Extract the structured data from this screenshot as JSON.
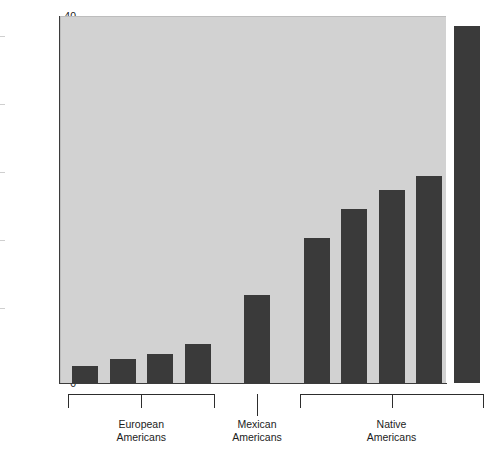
{
  "chart_data": {
    "type": "bar",
    "title": "",
    "xlabel": "",
    "ylabel": "Prevalence rate of diabetes (%)",
    "ylim": [
      0,
      40
    ],
    "yticks": [
      0,
      5,
      10,
      15,
      20,
      25,
      30,
      35,
      40
    ],
    "ytick_labels": [
      "0",
      "5",
      "10",
      "15",
      "20",
      "25",
      "30",
      "35",
      "40"
    ],
    "grid": false,
    "legend": "none",
    "bar_color": "#3a3a3a",
    "plot_background": "#d2d2d2",
    "categories": [
      "1",
      "2",
      "3",
      "4",
      "5",
      "6",
      "7",
      "8",
      "9",
      "10"
    ],
    "values": [
      1.9,
      2.6,
      3.2,
      4.3,
      9.6,
      15.8,
      19.0,
      21.0,
      22.6,
      38.9
    ],
    "groups": [
      {
        "label": "European\nAmericans",
        "label_line1": "European",
        "label_line2": "Americans",
        "bar_indices": [
          0,
          1,
          2,
          3
        ]
      },
      {
        "label": "Mexican\nAmericans",
        "label_line1": "Mexican",
        "label_line2": "Americans",
        "bar_indices": [
          4
        ]
      },
      {
        "label": "Native\nAmericans",
        "label_line1": "Native",
        "label_line2": "Americans",
        "bar_indices": [
          5,
          6,
          7,
          8,
          9
        ]
      }
    ]
  }
}
